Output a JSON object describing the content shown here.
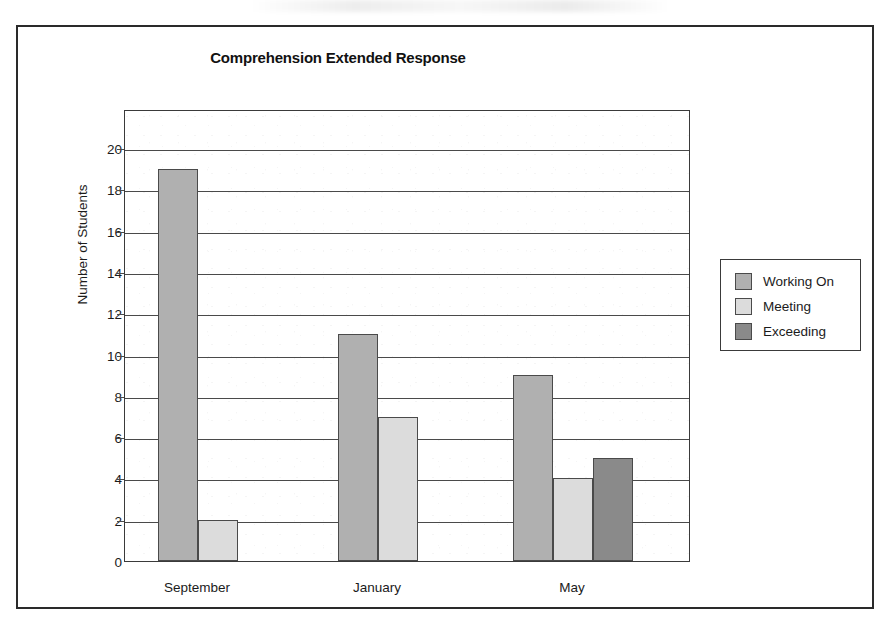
{
  "chart_data": {
    "type": "bar",
    "title": "Comprehension Extended Response",
    "xlabel": "",
    "ylabel": "Number of Students",
    "categories": [
      "September",
      "January",
      "May"
    ],
    "series": [
      {
        "name": "Working On",
        "values": [
          19,
          11,
          9
        ],
        "color": "#b0b0b0"
      },
      {
        "name": "Meeting",
        "values": [
          2,
          7,
          4
        ],
        "color": "#dcdcdc"
      },
      {
        "name": "Exceeding",
        "values": [
          0,
          0,
          5
        ],
        "color": "#8a8a8a"
      }
    ],
    "ylim": [
      0,
      21.9
    ],
    "yticks": [
      0,
      2,
      4,
      6,
      8,
      10,
      12,
      14,
      16,
      18,
      20
    ],
    "ytick_labels": [
      "0",
      "2",
      "4",
      "6",
      "8",
      "10",
      "12",
      "14",
      "16",
      "18",
      "20"
    ],
    "grid": true,
    "grid_axis": "y",
    "legend_position": "right-outside",
    "bar_gap": "none",
    "frame": true
  },
  "legend": {
    "entries": [
      {
        "label": "Working On",
        "color": "#b0b0b0"
      },
      {
        "label": "Meeting",
        "color": "#dcdcdc"
      },
      {
        "label": "Exceeding",
        "color": "#8a8a8a"
      }
    ]
  }
}
